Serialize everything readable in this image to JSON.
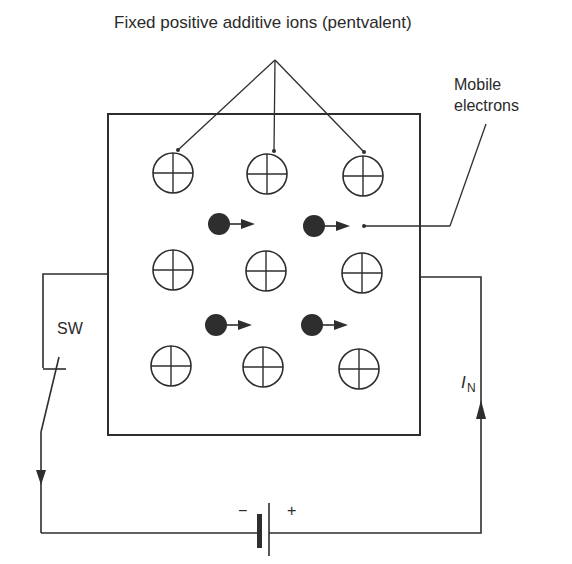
{
  "diagram": {
    "title": "Fixed positive additive ions (pentvalent)",
    "labels": {
      "mobile_line1": "Mobile",
      "mobile_line2": "electrons",
      "switch": "SW",
      "current_symbol": "I",
      "current_subscript": "N",
      "battery_negative": "−",
      "battery_positive": "+"
    },
    "colors": {
      "ink": "#2e2e2e",
      "background": "#ffffff"
    },
    "crystal": {
      "box": {
        "x": 108,
        "y": 114,
        "width": 312,
        "height": 321
      },
      "ions": [
        {
          "row": 1,
          "col": 1,
          "cx": 173,
          "cy": 173
        },
        {
          "row": 1,
          "col": 2,
          "cx": 267,
          "cy": 174
        },
        {
          "row": 1,
          "col": 3,
          "cx": 363,
          "cy": 176
        },
        {
          "row": 2,
          "col": 1,
          "cx": 173,
          "cy": 270
        },
        {
          "row": 2,
          "col": 2,
          "cx": 266,
          "cy": 271
        },
        {
          "row": 2,
          "col": 3,
          "cx": 362,
          "cy": 273
        },
        {
          "row": 3,
          "col": 1,
          "cx": 171,
          "cy": 366
        },
        {
          "row": 3,
          "col": 2,
          "cx": 263,
          "cy": 367
        },
        {
          "row": 3,
          "col": 3,
          "cx": 359,
          "cy": 369
        }
      ],
      "electrons": [
        {
          "cx": 219,
          "cy": 224,
          "direction": "right"
        },
        {
          "cx": 314,
          "cy": 226,
          "direction": "right"
        },
        {
          "cx": 216,
          "cy": 325,
          "direction": "right"
        },
        {
          "cx": 312,
          "cy": 325,
          "direction": "right"
        }
      ]
    }
  }
}
